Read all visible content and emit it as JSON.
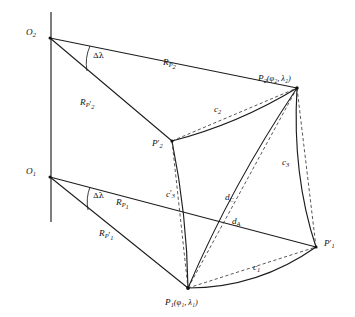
{
  "figure": {
    "background_color": "#ffffff",
    "line_color": "#1c1c1c",
    "dashed_color": "#3a3a3a"
  },
  "points": {
    "o2": {
      "label": "O",
      "sub": "2",
      "x": 50,
      "y": 38
    },
    "o1": {
      "label": "O",
      "sub": "1",
      "x": 50,
      "y": 177
    },
    "p2": {
      "label": "P",
      "sub": "2",
      "coords": "(φ₂, λ₂)",
      "x": 297,
      "y": 88
    },
    "p2p": {
      "label": "P",
      "sub": "2",
      "prime": "′",
      "x": 172,
      "y": 141
    },
    "p1": {
      "label": "P",
      "sub": "1",
      "coords": "(φ₁, λ₁)",
      "x": 188,
      "y": 288
    },
    "p1p": {
      "label": "P",
      "sub": "1",
      "prime": "′",
      "x": 316,
      "y": 247
    }
  },
  "labels": {
    "angle_upper": "Δλ",
    "angle_lower": "Δλ",
    "r_p2": {
      "base": "R",
      "sub": "P",
      "subsub": "2"
    },
    "r_p2_prime": {
      "base": "R",
      "sub": "P",
      "prime": "′",
      "subsub": "2"
    },
    "r_p1": {
      "base": "R",
      "sub": "P",
      "subsub": "1"
    },
    "r_p1_prime": {
      "base": "R",
      "sub": "P",
      "prime": "′",
      "subsub": "1"
    },
    "c1": {
      "base": "c",
      "sub": "1"
    },
    "c2": {
      "base": "c",
      "sub": "2"
    },
    "c3": {
      "base": "c",
      "sub": "3"
    },
    "c3_prime": {
      "base": "c",
      "prime": "′",
      "sub": "3"
    },
    "d_a": {
      "base": "d",
      "sub": "A"
    },
    "d_c": {
      "base": "d",
      "sub": "C"
    },
    "phi2": "φ",
    "lambda2": "λ"
  },
  "geometry": {
    "axis": {
      "x": 51,
      "y_top": 12,
      "y_bottom": 222
    },
    "rays": [
      {
        "name": "o2-to-p2",
        "from": "o2",
        "to": "p2"
      },
      {
        "name": "o2-to-p2prime",
        "from": "o2",
        "to": "p2p"
      },
      {
        "name": "o1-to-p1prime",
        "from": "o1",
        "to": "p1p"
      },
      {
        "name": "o1-to-p1",
        "from": "o1",
        "to": "p1"
      }
    ],
    "arcs": [
      {
        "name": "arc-c2",
        "from": "p2p",
        "to": "p2"
      },
      {
        "name": "arc-c3",
        "from": "p2",
        "to": "p1p"
      },
      {
        "name": "arc-c3-prime",
        "from": "p2p",
        "to": "p1"
      },
      {
        "name": "arc-c1",
        "from": "p1",
        "to": "p1p"
      }
    ],
    "chords": [
      {
        "name": "chord-c2",
        "from": "p2p",
        "to": "p2"
      },
      {
        "name": "chord-c3",
        "from": "p2",
        "to": "p1p"
      },
      {
        "name": "chord-c3-prime",
        "from": "p2p",
        "to": "p1"
      },
      {
        "name": "chord-c1",
        "from": "p1",
        "to": "p1p"
      },
      {
        "name": "chord-dc",
        "from": "p2",
        "to": "p1"
      }
    ],
    "diagonals": [
      {
        "name": "diagonal-da",
        "from": "p2",
        "to": "p1",
        "style": "solid"
      },
      {
        "name": "diagonal-dc",
        "from": "p2",
        "to": "p1",
        "style": "dashed"
      }
    ]
  }
}
